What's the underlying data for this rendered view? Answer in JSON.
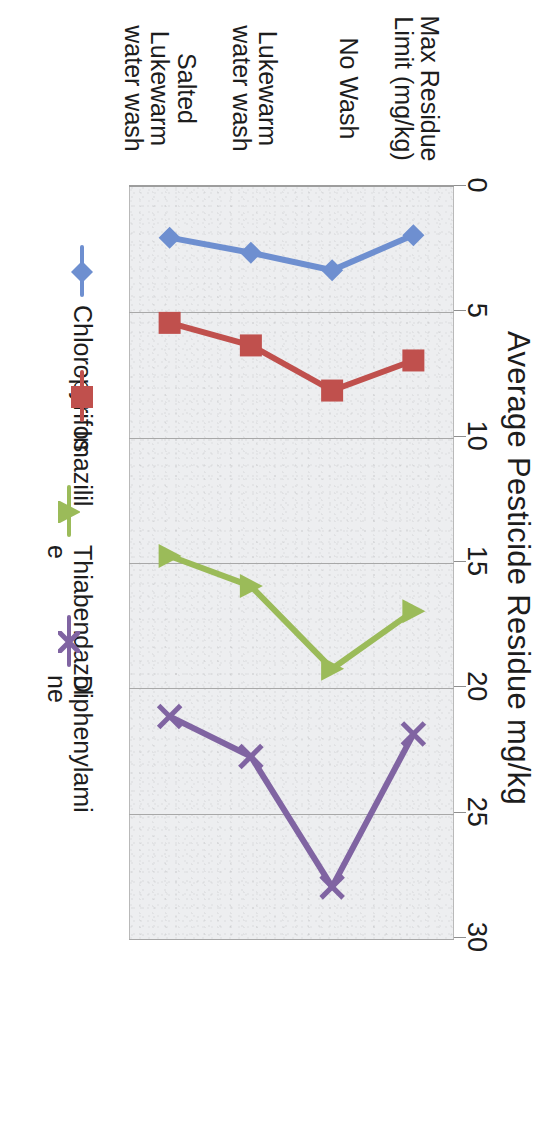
{
  "chart_data": {
    "type": "line",
    "title": "",
    "xlabel": "",
    "ylabel": "Average Pesticide Residue mg/kg",
    "orientation": "rotated-90-clockwise",
    "grid": true,
    "legend_position": "bottom",
    "axis_title": "Average Pesticide Residue mg/kg",
    "value_ticks": [
      "0",
      "5",
      "10",
      "15",
      "20",
      "25",
      "30"
    ],
    "value_tick_values": [
      0,
      5,
      10,
      15,
      20,
      25,
      30
    ],
    "ylim": [
      0,
      30
    ],
    "categories": [
      "Max Residue Limit (mg/kg)",
      "No Wash",
      "Lukewarm water wash",
      "Salted Lukewarm water wash"
    ],
    "series": [
      {
        "name": "Chloropyrifos",
        "label_lines": "Chloropyrifos",
        "color": "#6E8FD0",
        "marker": "diamond",
        "values": [
          2.0,
          3.4,
          2.7,
          2.1
        ]
      },
      {
        "name": "Imazilil",
        "label_lines": "Imazilil",
        "color": "#C0504D",
        "marker": "square",
        "values": [
          7.0,
          8.2,
          6.4,
          5.5
        ]
      },
      {
        "name": "Thiabendazole",
        "label_lines": "Thiabendazol\ne",
        "color": "#9BBB59",
        "marker": "triangle",
        "values": [
          17.0,
          19.3,
          16.0,
          14.8
        ]
      },
      {
        "name": "Diphenylamine",
        "label_lines": "Diphenylami\nne",
        "color": "#8064A2",
        "marker": "cross",
        "values": [
          21.9,
          28.0,
          22.8,
          21.2
        ]
      }
    ]
  }
}
